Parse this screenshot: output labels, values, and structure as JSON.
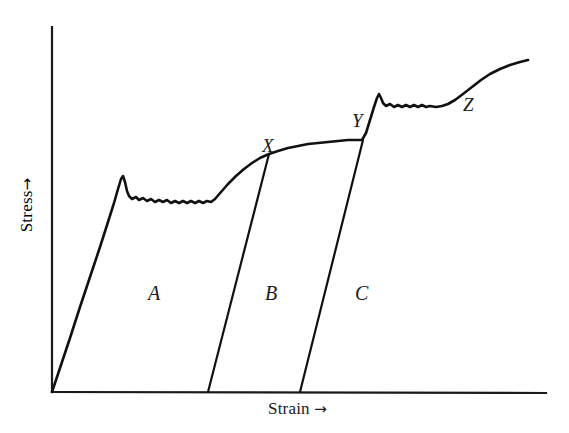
{
  "figure": {
    "axes": {
      "y_label": "Stress",
      "y_label_arrow": "→",
      "x_label": "Strain",
      "x_label_arrow": "→",
      "origin_px": [
        52,
        392
      ],
      "y_axis_top_px": [
        52,
        27
      ],
      "x_axis_right_px": [
        546,
        393
      ]
    },
    "point_labels": [
      {
        "text": "X",
        "x_px": 262,
        "y_px": 136
      },
      {
        "text": "Y",
        "x_px": 352,
        "y_px": 111
      },
      {
        "text": "Z",
        "x_px": 463,
        "y_px": 95
      }
    ],
    "region_labels": [
      {
        "text": "A",
        "x_px": 148,
        "y_px": 283
      },
      {
        "text": "B",
        "x_px": 265,
        "y_px": 283
      },
      {
        "text": "C",
        "x_px": 355,
        "y_px": 283
      }
    ]
  },
  "chart_data": {
    "type": "line",
    "title": "",
    "xlabel": "Strain",
    "ylabel": "Stress",
    "grid": false,
    "legend": "none",
    "axes_style": "arrow-terminated, unlabelled ticks",
    "xlim": [
      0,
      1
    ],
    "ylim": [
      0,
      1
    ],
    "series": [
      {
        "name": "loading-curve",
        "role": "main stress-strain curve",
        "points_px": [
          [
            52,
            392
          ],
          [
            60,
            368
          ],
          [
            70,
            338
          ],
          [
            80,
            307
          ],
          [
            90,
            277
          ],
          [
            100,
            247
          ],
          [
            108,
            222
          ],
          [
            114,
            203
          ],
          [
            118,
            189
          ],
          [
            121,
            179
          ],
          [
            123,
            176
          ],
          [
            125,
            182
          ],
          [
            127,
            191
          ],
          [
            129,
            196
          ],
          [
            132,
            199
          ],
          [
            136,
            197
          ],
          [
            139,
            200
          ],
          [
            143,
            198
          ],
          [
            147,
            201
          ],
          [
            151,
            199
          ],
          [
            155,
            202
          ],
          [
            159,
            200
          ],
          [
            163,
            202
          ],
          [
            167,
            200
          ],
          [
            171,
            203
          ],
          [
            175,
            201
          ],
          [
            179,
            203
          ],
          [
            183,
            201
          ],
          [
            187,
            203
          ],
          [
            191,
            201
          ],
          [
            195,
            203
          ],
          [
            199,
            201
          ],
          [
            203,
            203
          ],
          [
            207,
            201
          ],
          [
            211,
            202
          ],
          [
            215,
            199
          ],
          [
            221,
            192
          ],
          [
            228,
            184
          ],
          [
            236,
            176
          ],
          [
            244,
            169
          ],
          [
            252,
            163
          ],
          [
            260,
            158
          ],
          [
            269,
            154
          ],
          [
            278,
            151
          ],
          [
            288,
            148
          ],
          [
            298,
            146
          ],
          [
            308,
            144
          ],
          [
            318,
            143
          ],
          [
            328,
            142
          ],
          [
            338,
            141
          ],
          [
            348,
            140
          ],
          [
            356,
            140
          ],
          [
            362,
            140
          ],
          [
            366,
            133
          ],
          [
            370,
            120
          ],
          [
            374,
            107
          ],
          [
            377,
            98
          ],
          [
            379,
            94
          ],
          [
            381,
            98
          ],
          [
            383,
            103
          ],
          [
            386,
            106
          ],
          [
            390,
            104
          ],
          [
            394,
            107
          ],
          [
            398,
            105
          ],
          [
            402,
            107
          ],
          [
            406,
            105
          ],
          [
            410,
            107
          ],
          [
            414,
            105
          ],
          [
            418,
            107
          ],
          [
            422,
            105
          ],
          [
            426,
            107
          ],
          [
            430,
            106
          ],
          [
            436,
            107
          ],
          [
            442,
            106
          ],
          [
            448,
            104
          ],
          [
            455,
            100
          ],
          [
            463,
            94
          ],
          [
            472,
            87
          ],
          [
            481,
            80
          ],
          [
            490,
            74
          ],
          [
            500,
            69
          ],
          [
            510,
            65
          ],
          [
            520,
            62
          ],
          [
            528,
            60
          ]
        ]
      },
      {
        "name": "unload-line-X",
        "role": "elastic unloading from point X",
        "points_px": [
          [
            269,
            154
          ],
          [
            208,
            392
          ]
        ]
      },
      {
        "name": "unload-line-Y",
        "role": "elastic unloading from point Y",
        "points_px": [
          [
            363,
            140
          ],
          [
            300,
            392
          ]
        ]
      }
    ],
    "annotations": [
      {
        "text": "X",
        "meaning": "unload/reload point on work-hardening curve"
      },
      {
        "text": "Y",
        "meaning": "second unload/reload point before yield-point return"
      },
      {
        "text": "Z",
        "meaning": "final work-hardening region"
      },
      {
        "text": "A",
        "meaning": "area under first unloading segment"
      },
      {
        "text": "B",
        "meaning": "area between first and second unloading segments"
      },
      {
        "text": "C",
        "meaning": "area right of second unloading segment"
      }
    ]
  }
}
